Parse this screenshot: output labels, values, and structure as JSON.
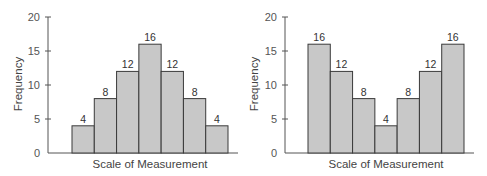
{
  "chart_data": [
    {
      "type": "bar",
      "title": "",
      "xlabel": "Scale of Measurement",
      "ylabel": "Frequency",
      "ylim": [
        0,
        20
      ],
      "yticks": [
        0,
        5,
        10,
        15,
        20
      ],
      "grid": false,
      "categories": [
        "1",
        "2",
        "3",
        "4",
        "5",
        "6",
        "7"
      ],
      "values": [
        4,
        8,
        12,
        16,
        12,
        8,
        4
      ],
      "data_labels": [
        "4",
        "8",
        "12",
        "16",
        "12",
        "8",
        "4"
      ],
      "bar_color": "#c8c8c8"
    },
    {
      "type": "bar",
      "title": "",
      "xlabel": "Scale of Measurement",
      "ylabel": "Frequency",
      "ylim": [
        0,
        20
      ],
      "yticks": [
        0,
        5,
        10,
        15,
        20
      ],
      "grid": false,
      "categories": [
        "1",
        "2",
        "3",
        "4",
        "5",
        "6",
        "7"
      ],
      "values": [
        16,
        12,
        8,
        4,
        8,
        12,
        16
      ],
      "data_labels": [
        "16",
        "12",
        "8",
        "4",
        "8",
        "12",
        "16"
      ],
      "bar_color": "#c8c8c8"
    }
  ]
}
